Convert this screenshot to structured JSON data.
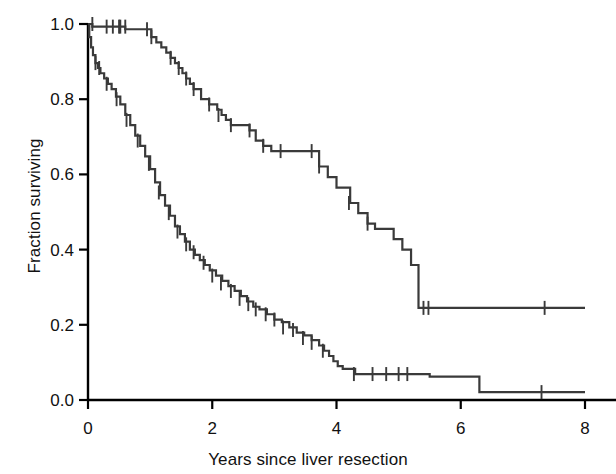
{
  "chart_data": {
    "type": "line",
    "subtype": "kaplan-meier-step",
    "title": "",
    "xlabel": "Years since liver resection",
    "ylabel": "Fraction surviving",
    "xlim": [
      0,
      8
    ],
    "ylim": [
      0.0,
      1.0
    ],
    "xticks": [
      0,
      2,
      4,
      6,
      8
    ],
    "xticklabels": [
      "0",
      "2",
      "4",
      "6",
      "8"
    ],
    "yticks": [
      0.0,
      0.2,
      0.4,
      0.6,
      0.8,
      1.0
    ],
    "yticklabels": [
      "0.0",
      "0.2",
      "0.4",
      "0.6",
      "0.8",
      "1.0"
    ],
    "grid": false,
    "legend": "none",
    "line_color": "#3a3a3a",
    "axis_color": "#000000",
    "series": [
      {
        "name": "upper-curve",
        "description": "Higher survival group",
        "steps_x": [
          0.0,
          0.07,
          0.16,
          0.3,
          0.4,
          0.52,
          0.6,
          0.95,
          1.02,
          1.1,
          1.18,
          1.26,
          1.33,
          1.4,
          1.46,
          1.52,
          1.58,
          1.64,
          1.7,
          1.82,
          1.95,
          2.08,
          2.15,
          2.22,
          2.3,
          2.38,
          2.52,
          2.6,
          2.7,
          2.82,
          2.95,
          3.6,
          3.72,
          3.86,
          4.0,
          4.12,
          4.22,
          4.35,
          4.5,
          4.62,
          4.78,
          4.92,
          5.06,
          5.2,
          5.32,
          8.0
        ],
        "steps_y": [
          1.0,
          0.993,
          0.993,
          0.993,
          0.993,
          0.993,
          0.986,
          0.986,
          0.965,
          0.951,
          0.938,
          0.924,
          0.91,
          0.896,
          0.883,
          0.869,
          0.855,
          0.841,
          0.827,
          0.8,
          0.786,
          0.772,
          0.758,
          0.745,
          0.731,
          0.731,
          0.731,
          0.717,
          0.69,
          0.676,
          0.662,
          0.662,
          0.621,
          0.593,
          0.565,
          0.565,
          0.524,
          0.497,
          0.469,
          0.455,
          0.455,
          0.428,
          0.4,
          0.359,
          0.245,
          0.245
        ],
        "censor_x": [
          0.07,
          0.3,
          0.4,
          0.5,
          0.52,
          0.6,
          0.95,
          1.02,
          1.33,
          1.46,
          1.58,
          1.7,
          1.95,
          2.1,
          2.3,
          2.6,
          2.82,
          3.1,
          3.6,
          3.72,
          4.2,
          4.5,
          5.4,
          5.48,
          7.35
        ],
        "censor_y": [
          1.0,
          0.993,
          0.993,
          0.993,
          0.993,
          0.993,
          0.986,
          0.965,
          0.91,
          0.883,
          0.855,
          0.827,
          0.786,
          0.758,
          0.731,
          0.717,
          0.676,
          0.662,
          0.662,
          0.621,
          0.524,
          0.469,
          0.245,
          0.245,
          0.245
        ],
        "final_value": 0.245
      },
      {
        "name": "lower-curve",
        "description": "Lower survival group",
        "steps_x": [
          0.0,
          0.02,
          0.05,
          0.08,
          0.12,
          0.16,
          0.2,
          0.26,
          0.32,
          0.38,
          0.45,
          0.52,
          0.6,
          0.68,
          0.76,
          0.84,
          0.92,
          1.0,
          1.08,
          1.16,
          1.24,
          1.32,
          1.4,
          1.48,
          1.56,
          1.64,
          1.72,
          1.8,
          1.88,
          1.96,
          2.06,
          2.16,
          2.26,
          2.36,
          2.46,
          2.56,
          2.66,
          2.76,
          2.88,
          3.0,
          3.12,
          3.24,
          3.36,
          3.48,
          3.6,
          3.72,
          3.8,
          3.88,
          3.95,
          4.02,
          4.1,
          4.3,
          5.5,
          6.3,
          8.0
        ],
        "steps_y": [
          1.0,
          0.965,
          0.938,
          0.917,
          0.896,
          0.883,
          0.869,
          0.855,
          0.841,
          0.827,
          0.807,
          0.786,
          0.758,
          0.731,
          0.703,
          0.676,
          0.648,
          0.614,
          0.579,
          0.545,
          0.517,
          0.49,
          0.462,
          0.441,
          0.421,
          0.4,
          0.386,
          0.372,
          0.359,
          0.345,
          0.331,
          0.317,
          0.303,
          0.29,
          0.276,
          0.262,
          0.248,
          0.241,
          0.228,
          0.214,
          0.207,
          0.193,
          0.179,
          0.172,
          0.159,
          0.145,
          0.131,
          0.117,
          0.103,
          0.09,
          0.083,
          0.069,
          0.062,
          0.021,
          0.021
        ],
        "censor_x": [
          0.12,
          0.18,
          0.3,
          0.46,
          0.62,
          0.8,
          0.98,
          1.14,
          1.3,
          1.44,
          1.58,
          1.7,
          1.86,
          2.0,
          2.14,
          2.3,
          2.44,
          2.58,
          2.7,
          2.86,
          3.0,
          3.14,
          3.3,
          3.46,
          3.6,
          3.78,
          4.28,
          4.58,
          4.8,
          5.0,
          5.14,
          7.3
        ],
        "censor_y": [
          0.896,
          0.883,
          0.841,
          0.8,
          0.745,
          0.69,
          0.628,
          0.552,
          0.497,
          0.448,
          0.414,
          0.393,
          0.365,
          0.331,
          0.31,
          0.29,
          0.269,
          0.255,
          0.241,
          0.228,
          0.214,
          0.193,
          0.186,
          0.165,
          0.152,
          0.131,
          0.069,
          0.069,
          0.069,
          0.069,
          0.069,
          0.021
        ],
        "final_value": 0.021
      }
    ]
  },
  "axes": {
    "x_title": "Years since liver resection",
    "y_title": "Fraction surviving"
  }
}
